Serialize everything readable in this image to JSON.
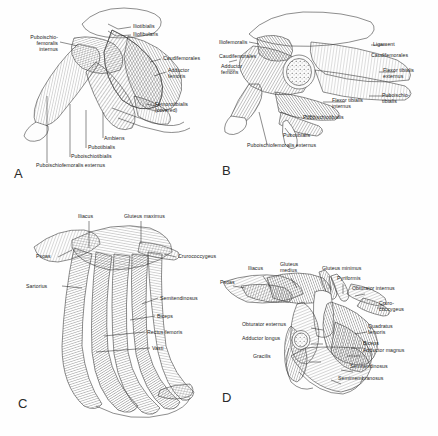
{
  "figure": {
    "background_color": "#ffffff",
    "ink_color": "#1b1b1b",
    "style": "grayscale pen-and-ink line art with parallel-line muscle hatching"
  },
  "panels": [
    {
      "id": "A",
      "letter": "A",
      "subject": "Reptile hindlimb, ventral view (superficial)",
      "labels": [
        {
          "name": "puboischiofemoralis-internus",
          "text": "Puboischio-\nfemoralis\ninternus",
          "x": 22,
          "y": 37,
          "align": "right"
        },
        {
          "name": "iliotibialis",
          "text": "Iliotibialis",
          "x": 133,
          "y": 26,
          "align": "left"
        },
        {
          "name": "iliofibularis",
          "text": "Iliofibularis",
          "x": 133,
          "y": 34,
          "align": "left"
        },
        {
          "name": "caudifemorales",
          "text": "Caudifemorales",
          "x": 163,
          "y": 58,
          "align": "left"
        },
        {
          "name": "adductor-femoris",
          "text": "Adductor\nfemoris",
          "x": 168,
          "y": 70,
          "align": "left"
        },
        {
          "name": "femorotibialis-covered",
          "text": "Femorotibialis\n(covered)",
          "x": 158,
          "y": 104,
          "align": "left"
        },
        {
          "name": "ambiens",
          "text": "Ambiens",
          "x": 104,
          "y": 138,
          "align": "left"
        },
        {
          "name": "pubotibialis",
          "text": "Pubotibialis",
          "x": 88,
          "y": 147,
          "align": "left"
        },
        {
          "name": "puboischiotibialis",
          "text": "Puboischiotibialis",
          "x": 72,
          "y": 156,
          "align": "left"
        },
        {
          "name": "puboischiofemoralis-externus",
          "text": "Puboischiofemoralis externus",
          "x": 36,
          "y": 165,
          "align": "left"
        }
      ]
    },
    {
      "id": "B",
      "letter": "B",
      "subject": "Reptile hindlimb, deeper dissection with femoral cross-section",
      "labels": [
        {
          "name": "iliofemoralis",
          "text": "Iliofemoralis",
          "x": 219,
          "y": 42,
          "align": "left"
        },
        {
          "name": "caudifemorales",
          "text": "Caudifemorales",
          "x": 219,
          "y": 56,
          "align": "left"
        },
        {
          "name": "adductor-femoris",
          "text": "Adductor\nfemoris",
          "x": 219,
          "y": 66,
          "align": "left"
        },
        {
          "name": "ligament",
          "text": "Ligament",
          "x": 373,
          "y": 44,
          "align": "left"
        },
        {
          "name": "caudifemorales-right",
          "text": "Caudifemorales",
          "x": 371,
          "y": 55,
          "align": "left"
        },
        {
          "name": "flexor-tibialis-externus",
          "text": "Flexor tibialis\nexternus",
          "x": 383,
          "y": 70,
          "align": "left"
        },
        {
          "name": "puboischiotibialis-right",
          "text": "Puboischio-\ntibialis",
          "x": 382,
          "y": 95,
          "align": "left"
        },
        {
          "name": "flexor-tibialis-internus",
          "text": "Flexor tibialis\ninternus",
          "x": 332,
          "y": 100,
          "align": "left"
        },
        {
          "name": "puboischiotibialis",
          "text": "Puboischiotibialis",
          "x": 303,
          "y": 117,
          "align": "left"
        },
        {
          "name": "pubotibialis",
          "text": "Pubotibialis",
          "x": 283,
          "y": 135,
          "align": "left"
        },
        {
          "name": "puboischiofemoralis-externus",
          "text": "Puboischiofemoralis externus",
          "x": 247,
          "y": 145,
          "align": "left"
        }
      ]
    },
    {
      "id": "C",
      "letter": "C",
      "subject": "Mammal hindlimb, superficial lateral view",
      "labels": [
        {
          "name": "iliacus",
          "text": "Iliacus",
          "x": 78,
          "y": 217,
          "align": "left"
        },
        {
          "name": "gluteus-maximus",
          "text": "Gluteus maximus",
          "x": 124,
          "y": 217,
          "align": "left"
        },
        {
          "name": "psoas",
          "text": "Psoas",
          "x": 36,
          "y": 256,
          "align": "left"
        },
        {
          "name": "crurococcygeus",
          "text": "Crurococcygeus",
          "x": 178,
          "y": 256,
          "align": "left"
        },
        {
          "name": "sartorius",
          "text": "Sartorius",
          "x": 40,
          "y": 283,
          "align": "left"
        },
        {
          "name": "semitendinosus",
          "text": "Semitendinosus",
          "x": 160,
          "y": 297,
          "align": "left"
        },
        {
          "name": "biceps",
          "text": "Biceps",
          "x": 157,
          "y": 315,
          "align": "left"
        },
        {
          "name": "rectus-femoris",
          "text": "Rectus femoris",
          "x": 147,
          "y": 330,
          "align": "left"
        },
        {
          "name": "vasti",
          "text": "Vasti",
          "x": 152,
          "y": 346,
          "align": "left"
        }
      ]
    },
    {
      "id": "D",
      "letter": "D",
      "subject": "Mammal hindlimb, deep dissection",
      "labels": [
        {
          "name": "iliacus",
          "text": "Iliacus",
          "x": 248,
          "y": 269,
          "align": "left"
        },
        {
          "name": "gluteus-medius",
          "text": "Gluteus\nmedius",
          "x": 280,
          "y": 265,
          "align": "left"
        },
        {
          "name": "gluteus-minimus",
          "text": "Gluteus minimus",
          "x": 322,
          "y": 269,
          "align": "left"
        },
        {
          "name": "psoas",
          "text": "Psoas",
          "x": 220,
          "y": 283,
          "align": "left"
        },
        {
          "name": "pyriformis",
          "text": "Pyriformis",
          "x": 337,
          "y": 279,
          "align": "left"
        },
        {
          "name": "obturator-internus",
          "text": "Obturator internus",
          "x": 352,
          "y": 289,
          "align": "left"
        },
        {
          "name": "crurococcygeus",
          "text": "Cruro-\ncoccygeus",
          "x": 379,
          "y": 305,
          "align": "left"
        },
        {
          "name": "obturator-externus",
          "text": "Obturator externus",
          "x": 242,
          "y": 325,
          "align": "left"
        },
        {
          "name": "quadratus-femoris",
          "text": "Quadratus\nfemoris",
          "x": 368,
          "y": 327,
          "align": "left"
        },
        {
          "name": "adductor-longus",
          "text": "Adductor longus",
          "x": 242,
          "y": 339,
          "align": "left"
        },
        {
          "name": "biceps",
          "text": "Biceps",
          "x": 363,
          "y": 344,
          "align": "left"
        },
        {
          "name": "adductor-magnus",
          "text": "Adductor magnus",
          "x": 363,
          "y": 351,
          "align": "left"
        },
        {
          "name": "gracilis",
          "text": "Gracilis",
          "x": 253,
          "y": 357,
          "align": "left"
        },
        {
          "name": "semitendinosus",
          "text": "Semitendinosus",
          "x": 350,
          "y": 367,
          "align": "left"
        },
        {
          "name": "semimembranosus",
          "text": "Semimembranosus",
          "x": 338,
          "y": 379,
          "align": "left"
        }
      ]
    }
  ]
}
